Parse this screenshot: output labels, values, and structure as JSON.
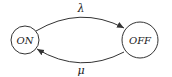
{
  "diagram": {
    "type": "state-transition",
    "states": [
      {
        "id": "on",
        "label": "ON"
      },
      {
        "id": "off",
        "label": "OFF"
      }
    ],
    "transitions": [
      {
        "from": "ON",
        "to": "OFF",
        "label": "λ"
      },
      {
        "from": "OFF",
        "to": "ON",
        "label": "μ"
      }
    ]
  }
}
